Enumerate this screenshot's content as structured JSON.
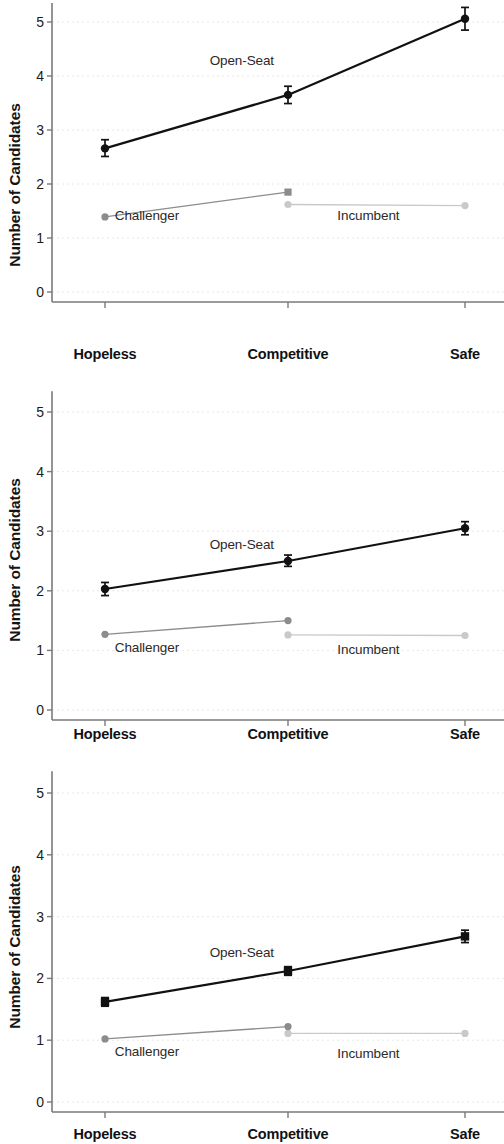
{
  "figure": {
    "panel_count": 3,
    "background_color": "#ffffff"
  },
  "axis": {
    "ylabel": "Number of Candidates",
    "yticks": [
      "0",
      "1",
      "2",
      "3",
      "4",
      "5"
    ],
    "xticks": [
      "Hopeless",
      "Competitive",
      "Safe"
    ]
  },
  "series_labels": {
    "open_seat": "Open-Seat",
    "challenger": "Challenger",
    "incumbent": "Incumbent"
  },
  "colors": {
    "open_seat": "#111111",
    "challenger": "#8c8c8c",
    "incumbent": "#c9c9c9",
    "gridline": "#e8e8e8",
    "axis": "#7a7a7a",
    "text": "#1b1b1b"
  },
  "chart_data": [
    {
      "type": "line",
      "panel_index": 1,
      "title": "",
      "xlabel": "",
      "ylabel": "Number of Candidates",
      "categories": [
        "Hopeless",
        "Competitive",
        "Safe"
      ],
      "ylim": [
        0,
        5.35
      ],
      "yticks": [
        0,
        1,
        2,
        3,
        4,
        5
      ],
      "grid": true,
      "legend": "inline-annotations",
      "series": [
        {
          "name": "Open-Seat",
          "color": "#111111",
          "marker": "circle",
          "values": [
            2.66,
            3.65,
            5.06
          ],
          "errors_low": [
            2.51,
            3.49,
            4.85
          ],
          "errors_high": [
            2.82,
            3.81,
            5.27
          ],
          "label_x": "Competitive",
          "label_position": [
            0.42,
            4.3
          ]
        },
        {
          "name": "Challenger",
          "color": "#8c8c8c",
          "marker": "circle-square",
          "values": [
            1.39,
            1.85,
            null
          ],
          "errors_low": [
            1.39,
            1.85,
            null
          ],
          "errors_high": [
            1.39,
            1.85,
            null
          ],
          "label_position": [
            0.21,
            1.42
          ]
        },
        {
          "name": "Incumbent",
          "color": "#c9c9c9",
          "marker": "circle",
          "values": [
            null,
            1.62,
            1.6
          ],
          "errors_low": [
            null,
            1.62,
            1.6
          ],
          "errors_high": [
            null,
            1.62,
            1.6
          ],
          "label_position": [
            0.7,
            1.42
          ]
        }
      ]
    },
    {
      "type": "line",
      "panel_index": 2,
      "title": "",
      "xlabel": "",
      "ylabel": "Number of Candidates",
      "categories": [
        "Hopeless",
        "Competitive",
        "Safe"
      ],
      "ylim": [
        0,
        5.35
      ],
      "yticks": [
        0,
        1,
        2,
        3,
        4,
        5
      ],
      "grid": true,
      "legend": "inline-annotations",
      "series": [
        {
          "name": "Open-Seat",
          "color": "#111111",
          "marker": "circle",
          "values": [
            2.03,
            2.5,
            3.05
          ],
          "errors_low": [
            1.92,
            2.41,
            2.94
          ],
          "errors_high": [
            2.14,
            2.6,
            3.16
          ],
          "label_position": [
            0.42,
            2.78
          ]
        },
        {
          "name": "Challenger",
          "color": "#8c8c8c",
          "marker": "circle",
          "values": [
            1.27,
            1.5,
            null
          ],
          "errors_low": [
            1.27,
            1.5,
            null
          ],
          "errors_high": [
            1.27,
            1.5,
            null
          ],
          "label_position": [
            0.21,
            1.06
          ]
        },
        {
          "name": "Incumbent",
          "color": "#c9c9c9",
          "marker": "circle",
          "values": [
            null,
            1.26,
            1.25
          ],
          "errors_low": [
            null,
            1.26,
            1.25
          ],
          "errors_high": [
            null,
            1.26,
            1.25
          ],
          "label_position": [
            0.7,
            1.03
          ]
        }
      ]
    },
    {
      "type": "line",
      "panel_index": 3,
      "title": "",
      "xlabel": "",
      "ylabel": "Number of Candidates",
      "categories": [
        "Hopeless",
        "Competitive",
        "Safe"
      ],
      "ylim": [
        0,
        5.35
      ],
      "yticks": [
        0,
        1,
        2,
        3,
        4,
        5
      ],
      "grid": true,
      "legend": "inline-annotations",
      "series": [
        {
          "name": "Open-Seat",
          "color": "#111111",
          "marker": "square",
          "values": [
            1.62,
            2.12,
            2.68
          ],
          "errors_low": [
            1.55,
            2.05,
            2.58
          ],
          "errors_high": [
            1.69,
            2.19,
            2.78
          ],
          "label_position": [
            0.42,
            2.42
          ]
        },
        {
          "name": "Challenger",
          "color": "#8c8c8c",
          "marker": "circle",
          "values": [
            1.02,
            1.22,
            null
          ],
          "errors_low": [
            1.02,
            1.22,
            null
          ],
          "errors_high": [
            1.02,
            1.22,
            null
          ],
          "label_position": [
            0.21,
            0.82
          ]
        },
        {
          "name": "Incumbent",
          "color": "#c9c9c9",
          "marker": "circle",
          "values": [
            null,
            1.11,
            1.11
          ],
          "errors_low": [
            null,
            1.11,
            1.11
          ],
          "errors_high": [
            null,
            1.11,
            1.11
          ],
          "label_position": [
            0.7,
            0.8
          ]
        }
      ]
    }
  ]
}
